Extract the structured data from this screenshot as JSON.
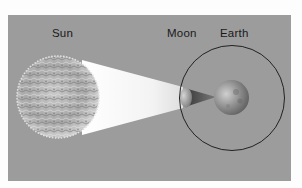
{
  "diagram": {
    "labels": {
      "sun": "Sun",
      "moon": "Moon",
      "earth": "Earth"
    },
    "colors": {
      "background": "#9c9c9c",
      "page": "#fdfdfd",
      "light_cone": "#f4f4f4",
      "shadow_cone": "#5a5a5a",
      "orbit": "#222222",
      "label_text": "#1a1a1a"
    },
    "elements": [
      {
        "name": "sun",
        "shape": "textured-sphere"
      },
      {
        "name": "light-cone",
        "shape": "cone from sun to moon"
      },
      {
        "name": "moon",
        "shape": "small sphere"
      },
      {
        "name": "shadow-cone",
        "shape": "umbra from moon to earth"
      },
      {
        "name": "earth",
        "shape": "sphere"
      },
      {
        "name": "moon-orbit",
        "shape": "circle around earth"
      }
    ]
  }
}
